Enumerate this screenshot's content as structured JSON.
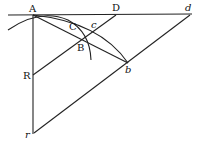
{
  "diagram": {
    "type": "geometric construction",
    "points": {
      "A": {
        "label": "A",
        "x": 33,
        "y": 15
      },
      "D": {
        "label": "D",
        "x": 116,
        "y": 15
      },
      "d": {
        "label": "d",
        "x": 190,
        "y": 15
      },
      "C": {
        "label": "C",
        "x": 72,
        "y": 27
      },
      "c": {
        "label": "c",
        "x": 98,
        "y": 29
      },
      "B": {
        "label": "B",
        "x": 82,
        "y": 40
      },
      "b": {
        "label": "b",
        "x": 127,
        "y": 62
      },
      "R": {
        "label": "R",
        "x": 33,
        "y": 75
      },
      "r": {
        "label": "r",
        "x": 33,
        "y": 133
      }
    },
    "segments": [
      "horizontal line through A, D, d",
      "vertical line A-R-r",
      "R-B-D",
      "r-b-d",
      "A-B-b"
    ],
    "arcs": [
      "arc through A, C, B (small circle)",
      "arc through A, c, b (large circle)"
    ]
  }
}
